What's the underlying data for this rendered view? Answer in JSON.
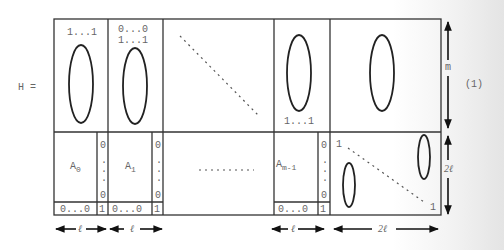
{
  "equation": {
    "lhs": "H =",
    "number": "(1)"
  },
  "top_row": {
    "block0": {
      "label": "1...1"
    },
    "block1": {
      "label_line1": "0...0",
      "label_line2": "1...1"
    },
    "block_last_m1": {
      "label": "1...1"
    }
  },
  "bottom_row": {
    "blocks": [
      {
        "label": "A",
        "subscript": "0",
        "column_top": "0",
        "column_dots": ".\n.\n.",
        "column_bottom": "0",
        "row_left": "0...0",
        "row_right": "1"
      },
      {
        "label": "A",
        "subscript": "1",
        "column_top": "0",
        "column_bottom": "0",
        "row_left": "0...0",
        "row_right": "1"
      },
      {
        "label": "A",
        "subscript": "m-1",
        "column_top": "0",
        "column_bottom": "0",
        "row_left": "0...0",
        "row_right": "1"
      }
    ],
    "middle_dots": "..........",
    "identity_top_left": "1",
    "identity_bottom_right": "1"
  },
  "dimensions": {
    "height_top": "m",
    "height_bottom": "2ℓ",
    "width_block": "ℓ",
    "width_last": "2ℓ"
  }
}
